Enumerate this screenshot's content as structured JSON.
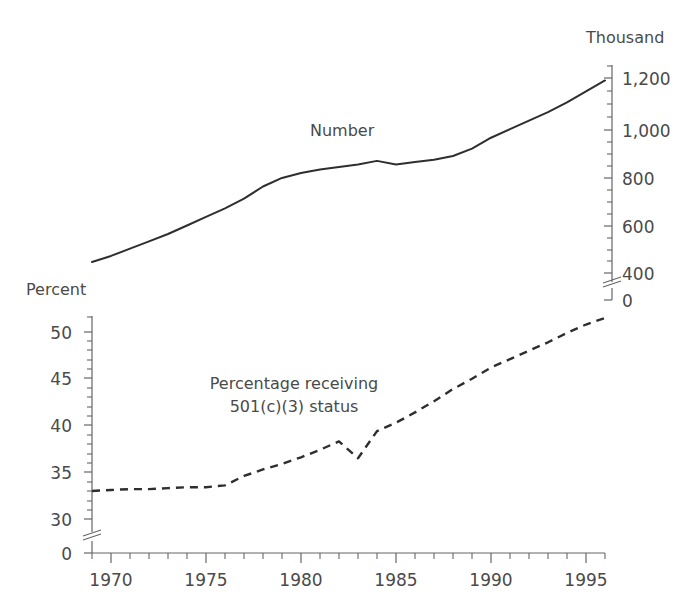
{
  "figure": {
    "background_color": "#ffffff",
    "line_color": "#2e2e2e",
    "axis_color": "#666666",
    "text_color": "#4a4a4a"
  },
  "labels": {
    "top_axis_unit": "Thousand",
    "bottom_axis_unit": "Percent",
    "number_series": "Number",
    "percent_annotation_line1": "Percentage receiving",
    "percent_annotation_line2": "501(c)(3) status"
  },
  "axes": {
    "x": {
      "ticks": [
        "1970",
        "1975",
        "1980",
        "1985",
        "1990",
        "1995"
      ],
      "tick_values": [
        1970,
        1975,
        1980,
        1985,
        1990,
        1995
      ],
      "range": [
        1969,
        1996
      ],
      "minor_interval": 1
    },
    "number_y": {
      "position": "right",
      "ticks": [
        "1,200",
        "1,000",
        "800",
        "600",
        "400",
        "0"
      ],
      "tick_values": [
        1200,
        1000,
        800,
        600,
        400,
        0
      ],
      "minor_interval": 50,
      "axis_break": true,
      "unit": "Thousand"
    },
    "percent_y": {
      "position": "left",
      "ticks": [
        "50",
        "45",
        "40",
        "35",
        "30",
        "0"
      ],
      "tick_values": [
        50,
        45,
        40,
        35,
        30,
        0
      ],
      "minor_interval": 1,
      "axis_break": true,
      "unit": "Percent"
    }
  },
  "chart_data": {
    "type": "line",
    "title": "",
    "xlabel": "",
    "ylabel": "Thousand / Percent",
    "grid": false,
    "legend": "inline-annotations",
    "panels": [
      {
        "name": "number-panel",
        "ylabel": "Thousand",
        "ylim": [
          400,
          1300
        ],
        "axis_break_below": 400,
        "series": [
          {
            "name": "Number",
            "style": "solid",
            "x": [
              1969,
              1970,
              1971,
              1972,
              1973,
              1974,
              1975,
              1976,
              1977,
              1978,
              1979,
              1980,
              1981,
              1982,
              1983,
              1984,
              1985,
              1986,
              1987,
              1988,
              1989,
              1990,
              1991,
              1992,
              1993,
              1994,
              1995,
              1996
            ],
            "values": [
              445,
              470,
              500,
              530,
              560,
              595,
              630,
              665,
              705,
              755,
              790,
              810,
              825,
              835,
              845,
              860,
              845,
              855,
              865,
              880,
              910,
              955,
              990,
              1025,
              1060,
              1100,
              1145,
              1190,
              1230,
              1272
            ]
          }
        ]
      },
      {
        "name": "percent-panel",
        "ylabel": "Percent",
        "ylim": [
          30,
          52
        ],
        "axis_break_below": 30,
        "series": [
          {
            "name": "Percentage receiving 501(c)(3) status",
            "style": "dashed",
            "x": [
              1969,
              1970,
              1971,
              1972,
              1973,
              1974,
              1975,
              1976,
              1977,
              1978,
              1979,
              1980,
              1981,
              1982,
              1983,
              1984,
              1985,
              1986,
              1987,
              1988,
              1989,
              1990,
              1991,
              1992,
              1993,
              1994,
              1995,
              1996
            ],
            "values": [
              33.0,
              33.1,
              33.2,
              33.2,
              33.3,
              33.4,
              33.4,
              33.6,
              34.6,
              35.3,
              35.9,
              36.6,
              37.4,
              38.3,
              36.5,
              39.4,
              40.3,
              41.4,
              42.6,
              43.9,
              45.0,
              46.2,
              47.1,
              48.0,
              48.9,
              49.9,
              50.8,
              51.5
            ]
          }
        ]
      }
    ]
  }
}
